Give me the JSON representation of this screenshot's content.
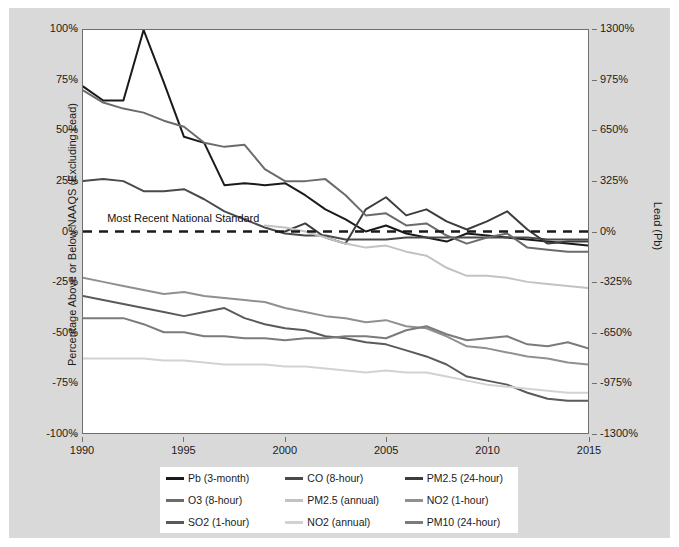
{
  "chart_data": {
    "type": "line",
    "title": "",
    "xlabel": "",
    "ylabel": "Percentage Above or Below NAAQS (Excluding Lead)",
    "y2label": "Lead (Pb)",
    "xlim": [
      1990,
      2015
    ],
    "ylim": [
      -100,
      100
    ],
    "y2lim": [
      -1300,
      1300
    ],
    "grid": false,
    "legend_position": "bottom",
    "xticks": [
      "1990",
      "1995",
      "2000",
      "2005",
      "2010",
      "2015"
    ],
    "xtick_values": [
      1990,
      1995,
      2000,
      2005,
      2010,
      2015
    ],
    "yticks": [
      "100%",
      "75%",
      "50%",
      "25%",
      "0%",
      "-25%",
      "-50%",
      "-75%",
      "-100%"
    ],
    "ytick_values": [
      100,
      75,
      50,
      25,
      0,
      -25,
      -50,
      -75,
      -100
    ],
    "y2ticks": [
      "1300%",
      "975%",
      "650%",
      "325%",
      "0%",
      "-325%",
      "-650%",
      "-975%",
      "-1300%"
    ],
    "y2tick_values": [
      1300,
      975,
      650,
      325,
      0,
      -325,
      -650,
      -975,
      -1300
    ],
    "annotations": [
      {
        "text": "Most Recent National Standard",
        "x": 1991.2,
        "y": 4.5
      }
    ],
    "reference_line": {
      "y": 0,
      "style": "dashed",
      "color": "#1a1a1a"
    },
    "x": [
      1990,
      1991,
      1992,
      1993,
      1994,
      1995,
      1996,
      1997,
      1998,
      1999,
      2000,
      2001,
      2002,
      2003,
      2004,
      2005,
      2006,
      2007,
      2008,
      2009,
      2010,
      2011,
      2012,
      2013,
      2014,
      2015
    ],
    "series": [
      {
        "name": "Pb (3-month)",
        "color": "#1a1a1a",
        "axis": "right",
        "values": [
          72,
          65,
          65,
          100,
          74,
          47,
          44,
          23,
          24,
          23,
          24,
          18,
          11,
          6,
          0,
          3,
          -1,
          -3,
          -5,
          -1,
          -2,
          -3,
          -4,
          -5,
          -6,
          -7
        ]
      },
      {
        "name": "CO (8-hour)",
        "color": "#4a4a4a",
        "axis": "left",
        "values": [
          25,
          26,
          25,
          20,
          20,
          21,
          16,
          10,
          6,
          2,
          -1,
          -2,
          -2,
          -4,
          -4,
          -4,
          -3,
          -3,
          -3,
          -3,
          -3,
          -3,
          -3,
          -4,
          -4,
          -4
        ]
      },
      {
        "name": "PM2.5 (24-hour)",
        "color": "#3d3d3d",
        "axis": "left",
        "values": [
          null,
          null,
          null,
          null,
          null,
          null,
          null,
          null,
          null,
          null,
          0,
          4,
          -3,
          -6,
          11,
          17,
          8,
          11,
          5,
          1,
          5,
          10,
          1,
          -6,
          -5,
          -5
        ]
      },
      {
        "name": "O3 (8-hour)",
        "color": "#6b6b6b",
        "axis": "left",
        "values": [
          70,
          64,
          61,
          59,
          55,
          52,
          44,
          42,
          43,
          31,
          25,
          25,
          26,
          18,
          8,
          9,
          3,
          4,
          -2,
          -6,
          -3,
          -1,
          -8,
          -9,
          -10,
          -10
        ]
      },
      {
        "name": "PM2.5 (annual)",
        "color": "#c2c2c2",
        "axis": "left",
        "values": [
          null,
          null,
          null,
          null,
          null,
          null,
          null,
          null,
          null,
          3,
          2,
          0,
          -3,
          -6,
          -8,
          -7,
          -10,
          -12,
          -18,
          -22,
          -22,
          -23,
          -25,
          -26,
          -27,
          -28
        ]
      },
      {
        "name": "NO2 (1-hour)",
        "color": "#909090",
        "axis": "left",
        "values": [
          -23,
          -25,
          -27,
          -29,
          -31,
          -30,
          -32,
          -33,
          -34,
          -35,
          -38,
          -40,
          -42,
          -43,
          -45,
          -44,
          -47,
          -48,
          -52,
          -57,
          -58,
          -60,
          -62,
          -63,
          -65,
          -66
        ]
      },
      {
        "name": "SO2 (1-hour)",
        "color": "#5a5a5a",
        "axis": "left",
        "values": [
          -32,
          -34,
          -36,
          -38,
          -40,
          -42,
          -40,
          -38,
          -43,
          -46,
          -48,
          -49,
          -52,
          -53,
          -55,
          -56,
          -59,
          -62,
          -66,
          -72,
          -74,
          -76,
          -80,
          -83,
          -84,
          -84
        ]
      },
      {
        "name": "NO2 (annual)",
        "color": "#d2d2d2",
        "axis": "left",
        "values": [
          -63,
          -63,
          -63,
          -63,
          -64,
          -64,
          -65,
          -66,
          -66,
          -66,
          -67,
          -67,
          -68,
          -69,
          -70,
          -69,
          -70,
          -70,
          -72,
          -74,
          -76,
          -77,
          -78,
          -79,
          -80,
          -80
        ]
      },
      {
        "name": "PM10 (24-hour)",
        "color": "#7b7b7b",
        "axis": "left",
        "values": [
          -43,
          -43,
          -43,
          -46,
          -50,
          -50,
          -52,
          -52,
          -53,
          -53,
          -54,
          -53,
          -53,
          -52,
          -52,
          -53,
          -49,
          -47,
          -51,
          -54,
          -53,
          -52,
          -56,
          -57,
          -55,
          -58
        ]
      }
    ]
  },
  "legend": {
    "items": [
      {
        "label": "Pb (3-month)",
        "color": "#1a1a1a"
      },
      {
        "label": "CO (8-hour)",
        "color": "#4a4a4a"
      },
      {
        "label": "PM2.5 (24-hour)",
        "color": "#3d3d3d"
      },
      {
        "label": "O3 (8-hour)",
        "color": "#6b6b6b"
      },
      {
        "label": "PM2.5 (annual)",
        "color": "#c2c2c2"
      },
      {
        "label": "NO2 (1-hour)",
        "color": "#909090"
      },
      {
        "label": "SO2 (1-hour)",
        "color": "#5a5a5a"
      },
      {
        "label": "NO2 (annual)",
        "color": "#d2d2d2"
      },
      {
        "label": "PM10 (24-hour)",
        "color": "#7b7b7b"
      }
    ]
  },
  "colors": {
    "figure_background": "#d9d9d9",
    "plot_background": "#ffffff",
    "axis": "#6f6f6f",
    "text": "#1b1b1b"
  }
}
